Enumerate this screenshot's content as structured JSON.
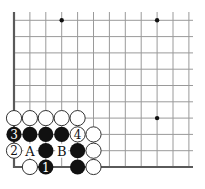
{
  "diagram": {
    "type": "go-board-corner",
    "corner": "bottom-left",
    "columns": 12,
    "rows": 10,
    "origin_x": 14,
    "origin_y": 167,
    "spacing_x": 15.9,
    "spacing_y": 16.3,
    "right_extent_x": 193,
    "top_extent_y": 20,
    "star_points": [
      {
        "col": 3,
        "row": 9
      },
      {
        "col": 9,
        "row": 9
      },
      {
        "col": 9,
        "row": 3
      }
    ],
    "stones": [
      {
        "col": 0,
        "row": 3,
        "color": "white",
        "label": ""
      },
      {
        "col": 1,
        "row": 3,
        "color": "white",
        "label": ""
      },
      {
        "col": 2,
        "row": 3,
        "color": "white",
        "label": ""
      },
      {
        "col": 3,
        "row": 3,
        "color": "white",
        "label": ""
      },
      {
        "col": 4,
        "row": 3,
        "color": "white",
        "label": ""
      },
      {
        "col": 0,
        "row": 2,
        "color": "black",
        "label": "3"
      },
      {
        "col": 1,
        "row": 2,
        "color": "black",
        "label": ""
      },
      {
        "col": 2,
        "row": 2,
        "color": "black",
        "label": ""
      },
      {
        "col": 3,
        "row": 2,
        "color": "black",
        "label": ""
      },
      {
        "col": 4,
        "row": 2,
        "color": "white",
        "label": "4"
      },
      {
        "col": 5,
        "row": 2,
        "color": "white",
        "label": ""
      },
      {
        "col": 0,
        "row": 1,
        "color": "white",
        "label": "2"
      },
      {
        "col": 2,
        "row": 1,
        "color": "black",
        "label": ""
      },
      {
        "col": 4,
        "row": 1,
        "color": "black",
        "label": ""
      },
      {
        "col": 5,
        "row": 1,
        "color": "white",
        "label": ""
      },
      {
        "col": 1,
        "row": 0,
        "color": "white",
        "label": ""
      },
      {
        "col": 2,
        "row": 0,
        "color": "black",
        "label": "1"
      },
      {
        "col": 4,
        "row": 0,
        "color": "black",
        "label": ""
      },
      {
        "col": 5,
        "row": 0,
        "color": "white",
        "label": ""
      }
    ],
    "point_labels": [
      {
        "col": 1,
        "row": 1,
        "text": "A"
      },
      {
        "col": 3,
        "row": 1,
        "text": "B"
      }
    ],
    "colors": {
      "grid": "#9a9a9a",
      "edge": "#5a5a5a",
      "black_stone": "#111111",
      "white_stone": "#ffffff"
    }
  }
}
